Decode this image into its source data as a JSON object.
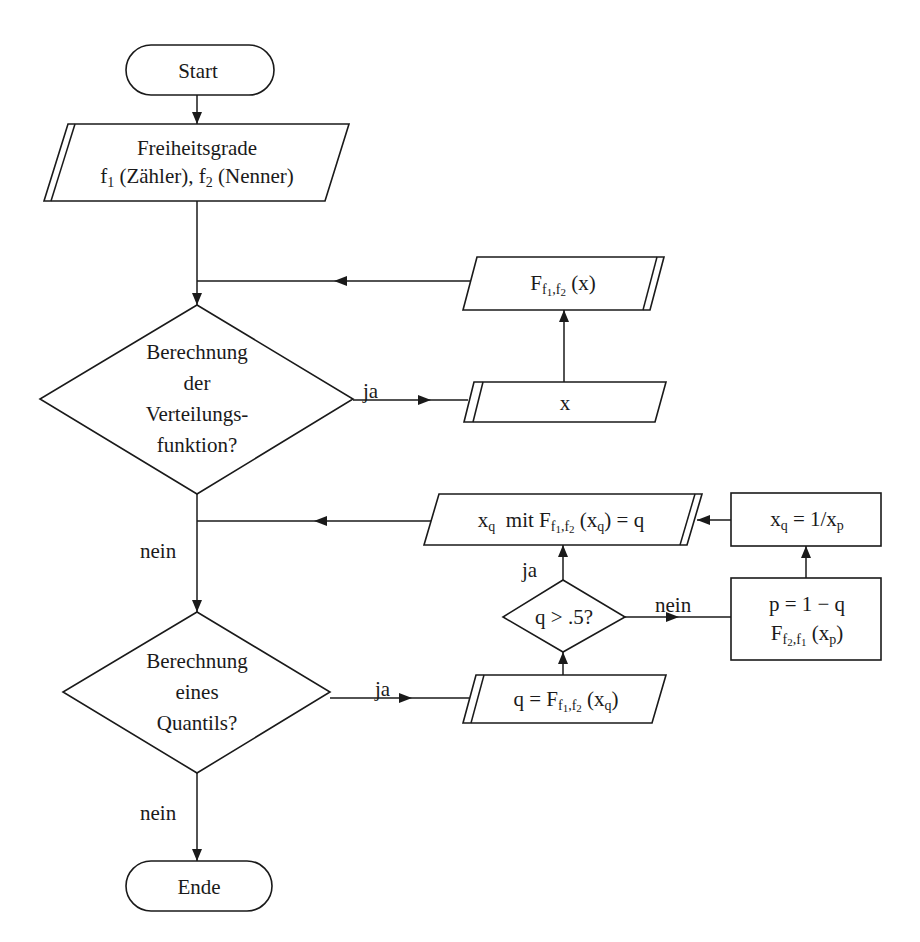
{
  "diagram": {
    "type": "flowchart",
    "language": "de",
    "nodes": {
      "start": {
        "shape": "terminal",
        "label": "Start"
      },
      "input_df": {
        "shape": "io-parallelogram",
        "line1": "Freiheitsgrade",
        "line2_f1": "f",
        "line2_f1_sub": "1",
        "line2_mid": " (Zähler), ",
        "line2_f2": "f",
        "line2_f2_sub": "2",
        "line2_end": " (Nenner)"
      },
      "decision_cdf": {
        "shape": "decision",
        "lines": [
          "Berechnung",
          "der",
          "Verteilungs-",
          "funktion?"
        ]
      },
      "input_x": {
        "shape": "io-parallelogram",
        "label": "x"
      },
      "output_cdf": {
        "shape": "io-parallelogram",
        "main": "F",
        "sub_a": "f",
        "sub_a_idx": "1",
        "sub_sep": ",",
        "sub_b": "f",
        "sub_b_idx": "2",
        "arg": " (x)"
      },
      "decision_quantile": {
        "shape": "decision",
        "lines": [
          "Berechnung",
          "eines",
          "Quantils?"
        ]
      },
      "input_q": {
        "shape": "io-parallelogram",
        "prefix": "q = F",
        "sub_a": "f",
        "sub_a_idx": "1",
        "sub_sep": ",",
        "sub_b": "f",
        "sub_b_idx": "2",
        "arg_open": " (x",
        "arg_sub": "q",
        "arg_close": ")"
      },
      "decision_half": {
        "shape": "decision",
        "label": "q > .5?"
      },
      "process_p": {
        "shape": "process",
        "line1": "p = 1 − q",
        "line2_main": "F",
        "line2_sub_a": "f",
        "line2_sub_a_idx": "2",
        "line2_sep": ",",
        "line2_sub_b": "f",
        "line2_sub_b_idx": "1",
        "line2_arg_open": " (x",
        "line2_arg_sub": "p",
        "line2_arg_close": ")"
      },
      "process_invert": {
        "shape": "process",
        "lhs": "x",
        "lhs_sub": "q",
        "eq": " = 1/x",
        "rhs_sub": "p"
      },
      "output_quantile": {
        "shape": "io-parallelogram",
        "lead": "x",
        "lead_sub": "q",
        "mid": "  mit F",
        "sub_a": "f",
        "sub_a_idx": "1",
        "sub_sep": ",",
        "sub_b": "f",
        "sub_b_idx": "2",
        "arg_open": " (x",
        "arg_sub": "q",
        "arg_close": ") = q"
      },
      "end": {
        "shape": "terminal",
        "label": "Ende"
      }
    },
    "edge_labels": {
      "cdf_yes": "ja",
      "cdf_no": "nein",
      "quantile_yes": "ja",
      "quantile_no": "nein",
      "half_yes": "ja",
      "half_no": "nein"
    },
    "edges": [
      {
        "from": "start",
        "to": "input_df"
      },
      {
        "from": "input_df",
        "to": "decision_cdf"
      },
      {
        "from": "decision_cdf",
        "to": "input_x",
        "label": "ja"
      },
      {
        "from": "input_x",
        "to": "output_cdf"
      },
      {
        "from": "output_cdf",
        "to": "decision_cdf"
      },
      {
        "from": "decision_cdf",
        "to": "decision_quantile",
        "label": "nein"
      },
      {
        "from": "decision_quantile",
        "to": "input_q",
        "label": "ja"
      },
      {
        "from": "input_q",
        "to": "decision_half"
      },
      {
        "from": "decision_half",
        "to": "output_quantile",
        "label": "ja"
      },
      {
        "from": "decision_half",
        "to": "process_p",
        "label": "nein"
      },
      {
        "from": "process_p",
        "to": "process_invert"
      },
      {
        "from": "process_invert",
        "to": "output_quantile"
      },
      {
        "from": "output_quantile",
        "to": "decision_quantile"
      },
      {
        "from": "decision_quantile",
        "to": "end",
        "label": "nein"
      }
    ],
    "colors": {
      "stroke": "#1a1a1a",
      "fill": "#ffffff",
      "background": "#ffffff"
    }
  }
}
